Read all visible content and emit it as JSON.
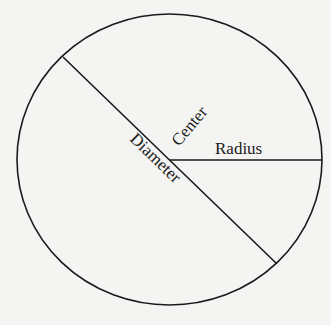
{
  "diagram": {
    "type": "circle-parts",
    "labels": {
      "center": "Center",
      "radius": "Radius",
      "diameter": "Diameter"
    },
    "colors": {
      "background": "#f4f4f2",
      "stroke": "#1a1a1a"
    }
  }
}
